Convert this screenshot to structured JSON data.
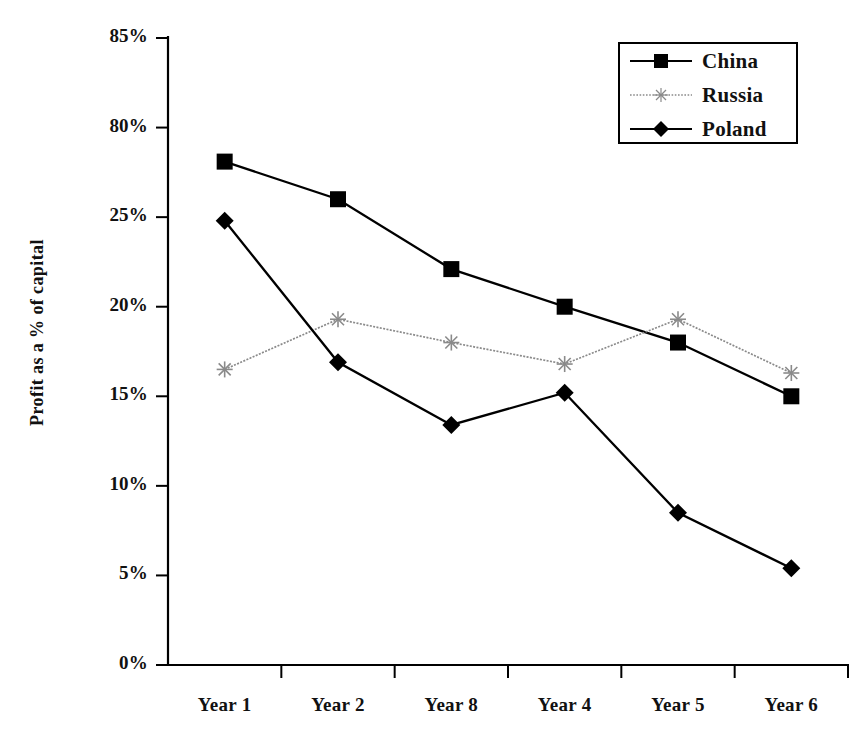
{
  "chart_data": {
    "type": "line",
    "title": "",
    "subtitle": "",
    "xlabel": "",
    "ylabel": "Profit as a % of capital",
    "categories": [
      "Year 1",
      "Year 2",
      "Year 8",
      "Year 4",
      "Year 5",
      "Year 6"
    ],
    "ytick_labels": [
      "85%",
      "80%",
      "25%",
      "20%",
      "15%",
      "10%",
      "5%",
      "0%"
    ],
    "ytick_values": [
      35,
      30,
      25,
      20,
      15,
      10,
      5,
      0
    ],
    "ylim": [
      0,
      35
    ],
    "grid": false,
    "legend_position": "top-right",
    "series": [
      {
        "name": "China",
        "marker": "square",
        "color": "#000000",
        "linestyle": "solid",
        "values": [
          28.1,
          26.0,
          22.1,
          20.0,
          18.0,
          15.0
        ]
      },
      {
        "name": "Russia",
        "marker": "star",
        "color": "#8a8a8a",
        "linestyle": "dotted",
        "values": [
          16.5,
          19.3,
          18.0,
          16.8,
          19.3,
          16.3
        ]
      },
      {
        "name": "Poland",
        "marker": "diamond",
        "color": "#000000",
        "linestyle": "solid",
        "values": [
          24.8,
          16.9,
          13.4,
          15.2,
          8.5,
          5.4
        ]
      }
    ]
  },
  "axis": {
    "y_title": "Profit as a % of capital"
  },
  "legend": {
    "entries": [
      {
        "label": "China"
      },
      {
        "label": "Russia"
      },
      {
        "label": "Poland"
      }
    ]
  }
}
